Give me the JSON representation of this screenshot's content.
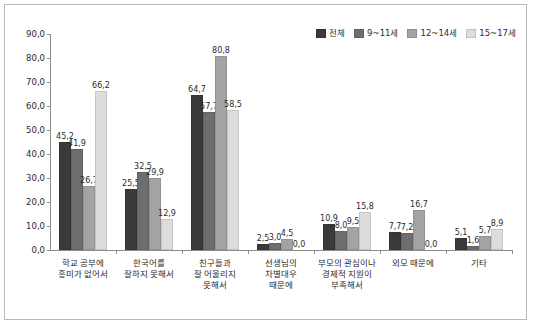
{
  "chart_data": {
    "type": "bar",
    "title": "",
    "xlabel": "",
    "ylabel": "",
    "ylim": [
      0,
      90
    ],
    "ytick_step": 10,
    "grid": false,
    "legend_position": "top-right",
    "categories": [
      "학교 공부에\n흥미가 없어서",
      "한국어를\n잘하지 못해서",
      "친구들과\n잘 어울리지\n못해서",
      "선생님의\n차별대우\n때문에",
      "부모의 관심이나\n경제적 지원이\n부족해서",
      "외모 때문에",
      "기타"
    ],
    "ytick_labels": [
      "0,0",
      "10,0",
      "20,0",
      "30,0",
      "40,0",
      "50,0",
      "60,0",
      "70,0",
      "80,0",
      "90,0"
    ],
    "series": [
      {
        "name": "전체",
        "color": "#3a3a3a",
        "values": [
          45.2,
          25.5,
          64.7,
          2.5,
          10.9,
          7.7,
          5.1
        ],
        "labels": [
          "45,2",
          "25,5",
          "64,7",
          "2,5",
          "10,9",
          "7,7",
          "5,1"
        ]
      },
      {
        "name": "9~11세",
        "color": "#6e6e6e",
        "values": [
          41.9,
          32.5,
          57.7,
          3.0,
          8.0,
          7.2,
          1.6
        ],
        "labels": [
          "41,9",
          "32,5",
          "57,7",
          "3,0",
          "8,0",
          "7,2",
          "1,6"
        ]
      },
      {
        "name": "12~14세",
        "color": "#a3a3a3",
        "values": [
          26.7,
          29.9,
          80.8,
          4.5,
          9.5,
          16.7,
          5.7
        ],
        "labels": [
          "26,7",
          "29,9",
          "80,8",
          "4,5",
          "9,5",
          "16,7",
          "5,7"
        ]
      },
      {
        "name": "15~17세",
        "color": "#dcdcdc",
        "values": [
          66.2,
          12.9,
          58.5,
          0.0,
          15.8,
          0.0,
          8.9
        ],
        "labels": [
          "66,2",
          "12,9",
          "58,5",
          "0,0",
          "15,8",
          "0,0",
          "8,9"
        ]
      }
    ]
  }
}
